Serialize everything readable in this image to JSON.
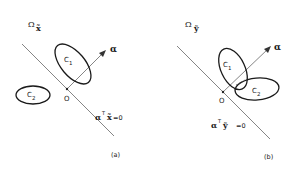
{
  "panels": [
    {
      "id": "a",
      "caption": "(a)",
      "space_label": "Ω",
      "space_sub": "x̃",
      "origin_label": "O",
      "vector_label": "α",
      "class1_label": "C",
      "class1_sub": "1",
      "class2_label": "C",
      "class2_sub": "2",
      "hyperplane_label_vec": "α",
      "hyperplane_label_sup": "T",
      "hyperplane_label_var": "x̃",
      "hyperplane_label_eq": "=0"
    },
    {
      "id": "b",
      "caption": "(b)",
      "space_label": "Ω",
      "space_sub": "ỹ",
      "origin_label": "O",
      "vector_label": "α",
      "class1_label": "C",
      "class1_sub": "1",
      "class2_label": "C",
      "class2_sub": "2",
      "hyperplane_label_vec": "α",
      "hyperplane_label_sup": "T",
      "hyperplane_label_var": "ỹ",
      "hyperplane_label_eq": "=0"
    }
  ],
  "colors": {
    "line": "#555555",
    "ellipse": "#1a1a1a",
    "text": "#1a1a1a"
  }
}
